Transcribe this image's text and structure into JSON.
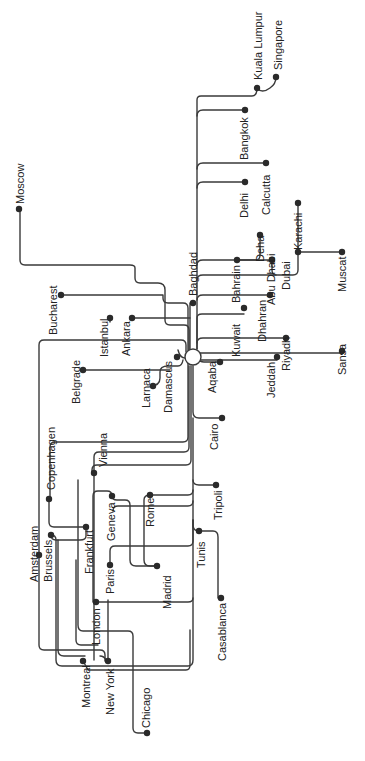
{
  "diagram": {
    "hub": {
      "name": "Amman",
      "x": 193,
      "y": 357,
      "r": 8
    },
    "colors": {
      "line": "#3a3a3a",
      "node": "#2a2a2a",
      "text": "#222222",
      "background": "#ffffff"
    },
    "cities": [
      {
        "name": "Kuala Lumpur",
        "x": 257,
        "y": 88,
        "lx": 262,
        "ly": 80
      },
      {
        "name": "Singapore",
        "x": 276,
        "y": 77,
        "lx": 282,
        "ly": 70
      },
      {
        "name": "Bangkok",
        "x": 245,
        "y": 110,
        "lx": 248,
        "ly": 160
      },
      {
        "name": "Calcutta",
        "x": 266,
        "y": 163,
        "lx": 270,
        "ly": 215
      },
      {
        "name": "Delhi",
        "x": 245,
        "y": 182,
        "lx": 248,
        "ly": 218
      },
      {
        "name": "Karachi",
        "x": 298,
        "y": 203,
        "lx": 302,
        "ly": 250
      },
      {
        "name": "Deha",
        "x": 260,
        "y": 235,
        "lx": 264,
        "ly": 262
      },
      {
        "name": "Bahrain",
        "x": 237,
        "y": 260,
        "lx": 240,
        "ly": 303
      },
      {
        "name": "Abu Dhabi",
        "x": 272,
        "y": 260,
        "lx": 275,
        "ly": 305
      },
      {
        "name": "Dubai",
        "x": 298,
        "y": 252,
        "lx": 290,
        "ly": 290
      },
      {
        "name": "Muscat",
        "x": 342,
        "y": 252,
        "lx": 346,
        "ly": 292
      },
      {
        "name": "Moscow",
        "x": 19,
        "y": 209,
        "lx": 24,
        "ly": 204
      },
      {
        "name": "Bucharest",
        "x": 61,
        "y": 295,
        "lx": 57,
        "ly": 335
      },
      {
        "name": "Baghdad",
        "x": 193,
        "y": 303,
        "lx": 197,
        "ly": 296
      },
      {
        "name": "Istanbul",
        "x": 110,
        "y": 318,
        "lx": 108,
        "ly": 357
      },
      {
        "name": "Ankara",
        "x": 132,
        "y": 318,
        "lx": 130,
        "ly": 356
      },
      {
        "name": "Kuwait",
        "x": 244,
        "y": 308,
        "lx": 240,
        "ly": 357
      },
      {
        "name": "Dhahran",
        "x": 270,
        "y": 295,
        "lx": 266,
        "ly": 342
      },
      {
        "name": "Riyadh",
        "x": 286,
        "y": 338,
        "lx": 290,
        "ly": 371
      },
      {
        "name": "Sansa",
        "x": 342,
        "y": 351,
        "lx": 346,
        "ly": 375
      },
      {
        "name": "Belgrade",
        "x": 83,
        "y": 370,
        "lx": 80,
        "ly": 404
      },
      {
        "name": "Larnaca",
        "x": 153,
        "y": 386,
        "lx": 150,
        "ly": 408
      },
      {
        "name": "Damascus",
        "x": 177,
        "y": 357,
        "lx": 172,
        "ly": 413
      },
      {
        "name": "Aqaba",
        "x": 220,
        "y": 362,
        "lx": 216,
        "ly": 393
      },
      {
        "name": "Jeddah",
        "x": 277,
        "y": 357,
        "lx": 275,
        "ly": 398
      },
      {
        "name": "Cairo",
        "x": 222,
        "y": 418,
        "lx": 218,
        "ly": 450
      },
      {
        "name": "Copenhagen",
        "x": 49,
        "y": 499,
        "lx": 55,
        "ly": 490
      },
      {
        "name": "Vienna",
        "x": 94,
        "y": 473,
        "lx": 107,
        "ly": 467
      },
      {
        "name": "Tripoli",
        "x": 216,
        "y": 485,
        "lx": 222,
        "ly": 520
      },
      {
        "name": "Geneva",
        "x": 112,
        "y": 496,
        "lx": 115,
        "ly": 541
      },
      {
        "name": "Rome",
        "x": 150,
        "y": 495,
        "lx": 154,
        "ly": 527
      },
      {
        "name": "Frankfurt",
        "x": 86,
        "y": 527,
        "lx": 93,
        "ly": 574
      },
      {
        "name": "Brussels",
        "x": 51,
        "y": 535,
        "lx": 52,
        "ly": 582
      },
      {
        "name": "Amsterdam",
        "x": 39,
        "y": 555,
        "lx": 38,
        "ly": 582
      },
      {
        "name": "Tunis",
        "x": 199,
        "y": 531,
        "lx": 205,
        "ly": 568
      },
      {
        "name": "Paris",
        "x": 110,
        "y": 565,
        "lx": 114,
        "ly": 594
      },
      {
        "name": "Madrid",
        "x": 157,
        "y": 566,
        "lx": 171,
        "ly": 609
      },
      {
        "name": "London",
        "x": 96,
        "y": 602,
        "lx": 100,
        "ly": 645
      },
      {
        "name": "Casablanca",
        "x": 221,
        "y": 598,
        "lx": 226,
        "ly": 661
      },
      {
        "name": "Montreal",
        "x": 83,
        "y": 661,
        "lx": 90,
        "ly": 708
      },
      {
        "name": "New York",
        "x": 108,
        "y": 661,
        "lx": 114,
        "ly": 715
      },
      {
        "name": "Chicago",
        "x": 147,
        "y": 733,
        "lx": 150,
        "ly": 728
      }
    ],
    "routes": [
      "M197,349 V100 Q197,96 201,96 H252 Q257,96 257,88",
      "M257,88 Q262,94 270,88 Q276,84 276,77",
      "M197,116 Q197,110 203,110 H245",
      "M197,169 Q197,163 203,163 H266",
      "M197,188 Q197,182 203,182 H245",
      "M197,265 Q197,260 203,260 H272",
      "M237,260 H256 Q260,260 260,255 V235",
      "M197,280 Q197,275 203,275 H293 Q298,275 298,270 V203",
      "M272,260 V270 Q272,275 276,275",
      "M298,252 H342",
      "M189,350 V330 Q189,325 184,325 H170 Q165,325 165,320 V290 Q165,283 158,283 H140 Q135,283 135,278 V268 Q135,265 130,265 H25 Q20,265 20,260 V209",
      "M188,350 V308 Q188,303 183,303 H168 Q163,303 163,298 V295 H61",
      "M190,349 V303",
      "M132,318 H190",
      "M110,318 V322",
      "M197,349 V318 Q197,314 202,314 H244",
      "M197,300 Q197,295 203,295 H270",
      "M197,343 Q197,338 203,338 H286",
      "M200,353 H342",
      "M200,360 H277",
      "M200,361 Q202,362 204,362 H220",
      "M185,358 Q180,358 178,350",
      "M150,386 Q160,386 160,378 V372 Q160,366 168,366 H178 Q182,366 183,360",
      "M83,370 H170",
      "M186,352 V345 Q186,340 181,340 H44 Q39,340 39,345 V555",
      "M188,362 V437 Q188,442 183,442 H55 Q50,442 50,447 V499",
      "M193,366 V412 Q193,418 199,418 H222",
      "M193,418 V480 Q193,485 199,485 H216",
      "M191,366 V460 Q191,465 186,465 H97 Q92,465 92,470 V473",
      "M189,366 V447 Q189,452 184,452 H99 Q94,452 94,457 V660",
      "M193,480 V490 Q193,495 188,495 H150",
      "M150,495 Q144,495 144,500 V560 Q144,566 150,566 H157",
      "M193,490 V501 Q193,506 188,506 H118 Q113,506 113,511",
      "M112,496 Q112,491 107,491 H98 Q93,491 93,496 V602",
      "M112,496 Q112,500 117,500 H125 Q130,500 130,505 V560 Q130,566 136,566 H157",
      "M193,501 V525 Q193,531 199,531 H213 Q218,531 218,537 V598",
      "M193,520 V541 Q193,546 188,546 H115 Q110,546 110,551 V565",
      "M49,499 V522 Q49,527 54,527 H86",
      "M86,527 V536 Q86,540 80,540 H56 Q51,540 51,535",
      "M51,535 Q56,535 56,540 V660 Q56,666 62,666 H188 Q193,666 193,660 V520",
      "M58,540 V650 Q58,656 64,656 H85",
      "M39,555 V645 Q39,650 44,650 H100 Q105,650 105,655 V661",
      "M76,560 V640 Q76,645 81,645 H98",
      "M83,661 Q86,666 88,670 H186 Q190,670 190,665 V630",
      "M96,602 H188 Q193,602 193,598",
      "M78,480 V625 Q78,631 83,631 H128 Q133,631 133,636 V728 Q133,733 138,733 H147",
      "M108,661 V600",
      "M100,656 Q104,656 106,660"
    ]
  }
}
